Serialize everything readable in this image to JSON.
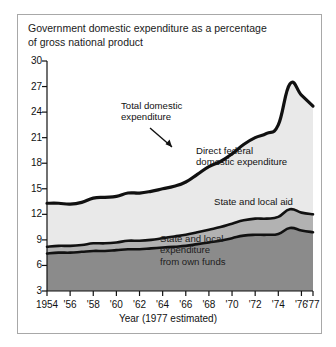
{
  "title": "Government domestic expenditure as a percentage of gross national product",
  "axis": {
    "xtitle": "Year (1977 estimated)",
    "yticks": [
      "3",
      "6",
      "9",
      "12",
      "15",
      "18",
      "21",
      "24",
      "27",
      "30"
    ],
    "xticks": [
      "1954",
      "'56",
      "'58",
      "'60",
      "'62",
      "'64",
      "'66",
      "'68",
      "'70",
      "'72",
      "'74",
      "'76",
      "'77"
    ]
  },
  "annotations": {
    "total": "Total domestic\nexpenditure",
    "direct": "Direct federal\ndomestic expenditure",
    "aid": "State and local aid",
    "own": "State and local\nexpenditure\nfrom own funds"
  },
  "colors": {
    "band_top": "#e9e9e9",
    "band_mid": "#b2b2b2",
    "band_bottom": "#8b8b8b",
    "line": "#111111",
    "border": "#a8a8a8"
  },
  "chart_data": {
    "type": "area",
    "title": "Government domestic expenditure as a percentage of gross national product",
    "xlabel": "Year (1977 estimated)",
    "ylabel": "",
    "xlim": [
      1954,
      1977
    ],
    "ylim": [
      0,
      30
    ],
    "ytick_values": [
      3,
      6,
      9,
      12,
      15,
      18,
      21,
      24,
      27,
      30
    ],
    "grid": false,
    "legend": "inline-annotations",
    "stacked": true,
    "x": [
      1954,
      1955,
      1956,
      1957,
      1958,
      1959,
      1960,
      1961,
      1962,
      1963,
      1964,
      1965,
      1966,
      1967,
      1968,
      1969,
      1970,
      1971,
      1972,
      1973,
      1974,
      1975,
      1976,
      1977
    ],
    "series": [
      {
        "name": "State and local expenditure from own funds",
        "values": [
          7.4,
          7.5,
          7.5,
          7.6,
          7.7,
          7.7,
          7.8,
          7.9,
          7.9,
          8.0,
          8.1,
          8.2,
          8.3,
          8.5,
          8.7,
          8.9,
          9.2,
          9.5,
          9.6,
          9.6,
          9.7,
          10.4,
          10.1,
          9.9
        ]
      },
      {
        "name": "State and local aid",
        "values": [
          0.8,
          0.8,
          0.8,
          0.8,
          0.9,
          0.9,
          0.9,
          1.0,
          1.0,
          1.0,
          1.1,
          1.2,
          1.3,
          1.4,
          1.5,
          1.6,
          1.7,
          1.8,
          1.9,
          1.9,
          2.0,
          2.2,
          2.1,
          2.1
        ]
      },
      {
        "name": "Direct federal domestic expenditure",
        "values": [
          5.1,
          5.0,
          4.9,
          5.0,
          5.3,
          5.4,
          5.4,
          5.6,
          5.6,
          5.7,
          5.8,
          5.9,
          6.2,
          6.8,
          7.4,
          7.7,
          8.2,
          8.9,
          9.5,
          10.0,
          10.8,
          14.7,
          13.8,
          12.7
        ]
      }
    ],
    "totals": [
      13.3,
      13.3,
      13.2,
      13.4,
      13.9,
      14.0,
      14.1,
      14.5,
      14.5,
      14.7,
      15.0,
      15.3,
      15.8,
      16.7,
      17.6,
      18.2,
      19.1,
      20.2,
      21.0,
      21.5,
      22.5,
      27.3,
      26.0,
      24.7
    ],
    "annotations": [
      {
        "text": "Total domestic expenditure",
        "arrow_to": [
          1962.2,
          15.0
        ]
      },
      {
        "text": "Direct federal domestic expenditure"
      },
      {
        "text": "State and local aid"
      },
      {
        "text": "State and local expenditure from own funds"
      }
    ]
  }
}
